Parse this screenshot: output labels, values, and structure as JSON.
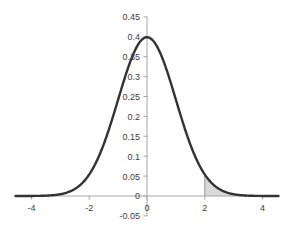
{
  "chart_data": {
    "type": "line",
    "title": "",
    "subtitle": "",
    "xlabel": "",
    "ylabel": "",
    "xlim": [
      -4.55,
      4.55
    ],
    "ylim": [
      -0.05,
      0.45
    ],
    "grid": false,
    "legend": false,
    "legend_position": "none",
    "series": [
      {
        "name": "standard normal pdf",
        "x": [
          -4.5,
          -4.25,
          -4,
          -3.75,
          -3.5,
          -3.25,
          -3,
          -2.75,
          -2.5,
          -2.25,
          -2,
          -1.75,
          -1.5,
          -1.25,
          -1,
          -0.75,
          -0.5,
          -0.25,
          0,
          0.25,
          0.5,
          0.75,
          1,
          1.25,
          1.5,
          1.75,
          2,
          2.25,
          2.5,
          2.75,
          3,
          3.25,
          3.5,
          3.75,
          4,
          4.25,
          4.5
        ],
        "y": [
          0.0,
          0.0001,
          0.0001,
          0.0004,
          0.0009,
          0.002,
          0.0044,
          0.0091,
          0.0175,
          0.0317,
          0.054,
          0.0863,
          0.1295,
          0.1826,
          0.242,
          0.3011,
          0.3521,
          0.3867,
          0.3989,
          0.3867,
          0.3521,
          0.3011,
          0.242,
          0.1826,
          0.1295,
          0.0863,
          0.054,
          0.0317,
          0.0175,
          0.0091,
          0.0044,
          0.002,
          0.0009,
          0.0004,
          0.0001,
          0.0001,
          0.0
        ]
      }
    ],
    "shaded_region": {
      "name": "right-tail",
      "from": 2,
      "to": 4.55,
      "fill": "#d9d9d9",
      "boundary_line_x": 2
    },
    "y_ticks": [
      {
        "value": 0.45,
        "label": "0.45"
      },
      {
        "value": 0.4,
        "label": "0.4"
      },
      {
        "value": 0.35,
        "label": "0.35"
      },
      {
        "value": 0.3,
        "label": "0.3"
      },
      {
        "value": 0.25,
        "label": "0.25"
      },
      {
        "value": 0.2,
        "label": "0.2"
      },
      {
        "value": 0.15,
        "label": "0.15"
      },
      {
        "value": 0.1,
        "label": "0.1"
      },
      {
        "value": 0.05,
        "label": "0.05"
      },
      {
        "value": 0.0,
        "label": "0"
      },
      {
        "value": -0.05,
        "label": "-0.05"
      }
    ],
    "x_ticks": [
      {
        "value": -4,
        "label": "-4"
      },
      {
        "value": -2,
        "label": "-2"
      },
      {
        "value": 0,
        "label": "0"
      },
      {
        "value": 2,
        "label": "2"
      },
      {
        "value": 4,
        "label": "4"
      }
    ],
    "colors": {
      "curve": "#333333",
      "axis": "#a6a6a6",
      "tick_text": "#3c3c3c",
      "shade_fill": "#d9d9d9",
      "shade_boundary": "#949494",
      "background": "#ffffff"
    }
  }
}
